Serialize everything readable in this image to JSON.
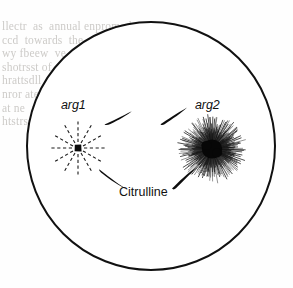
{
  "figure": {
    "kind": "petri-dish-cross-feeding-diagram",
    "background_color": "#ffffff",
    "ink_color": "#111111",
    "dish": {
      "name": "agar-plate-outline",
      "center_x": 151,
      "center_y": 146,
      "radius": 124,
      "stroke_width": 2.0,
      "fill": "#ffffff",
      "stroke": "#111111"
    },
    "colonies": [
      {
        "id": "arg1",
        "label": "arg1",
        "label_style": "italic",
        "label_x": 61,
        "label_y": 98,
        "center_x": 78,
        "center_y": 148,
        "core_radius": 3.2,
        "ray_count": 12,
        "ray_inner_radius": 6,
        "ray_outer_radius": 27,
        "ray_style": "dashed",
        "ray_stroke_width": 1.1,
        "description": "small dark core with 12 sparse dashed rays"
      },
      {
        "id": "arg2",
        "label": "arg2",
        "label_style": "italic",
        "label_x": 195,
        "label_y": 98,
        "center_x": 212,
        "center_y": 149,
        "core_radius": 9.5,
        "ray_count": 150,
        "ray_inner_radius": 7,
        "ray_outer_radius": 34,
        "ray_style": "solid",
        "ray_stroke_width": 0.7,
        "description": "large black core with dense solid starburst rays"
      }
    ],
    "arrows": [
      {
        "id": "arrow-top-left",
        "from": "arg1",
        "to": "arg2",
        "path": "upper-arc-left-segment",
        "tip_x": 131,
        "tip_y": 112,
        "tail_x": 106,
        "tail_y": 123,
        "direction": "up-right"
      },
      {
        "id": "arrow-top-right",
        "from": "arg1",
        "to": "arg2",
        "path": "upper-arc-right-segment",
        "tip_x": 186,
        "tip_y": 108,
        "tail_x": 162,
        "tail_y": 123,
        "direction": "up-right"
      },
      {
        "id": "arrow-bottom-left",
        "from": "arg1",
        "to": "arg2",
        "path": "lower-arc-left-segment",
        "tip_x": 126,
        "tip_y": 188,
        "tail_x": 100,
        "tail_y": 170,
        "direction": "down-right"
      },
      {
        "id": "arrow-bottom-right",
        "from": "arg1",
        "to": "arg2",
        "path": "lower-arc-right-segment",
        "tip_x": 196,
        "tip_y": 168,
        "tail_x": 173,
        "tail_y": 188,
        "direction": "up-right"
      }
    ],
    "annotations": [
      {
        "id": "citrulline",
        "text": "Citrulline",
        "style": "plain",
        "x": 119,
        "y": 185
      }
    ]
  },
  "labels": {
    "arg1": "arg1",
    "arg2": "arg2",
    "citrulline": "Citrulline"
  },
  "bleed_through": {
    "note": "faint show-through text from reverse of scanned page, illegible",
    "left_block": "llectr  as  annual enpromed  q\nccd  towards  the  grain  chicken  of  what\nwy fbeew  ve   ile   jle    waral  illrequire\nshotrsst of  thesfcih  hvv  yealls  separ-rouul\nhrattsdll   wrrowiant  (D  (seCn D  1 have vd\nnror ate  attray  y g y     lirrd  ac  cpe   wedy\nat ne  and  m w  kkaa  thu  tsngercor  tr  ohe\nhtstrssovn   ulllos  ret  kesstlorsrcee",
    "right_block": "",
    "bottom_block": ""
  }
}
